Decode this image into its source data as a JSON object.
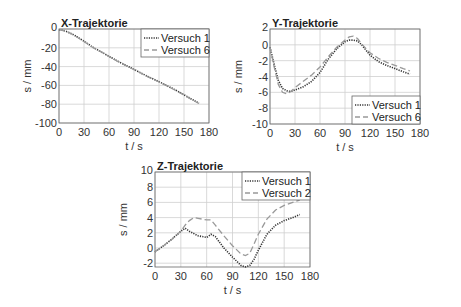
{
  "chart_data": [
    {
      "type": "line",
      "id": "x",
      "title": "X-Trajektorie",
      "xlabel": "t / s",
      "ylabel": "s / mm",
      "xlim": [
        0,
        180
      ],
      "ylim": [
        -100,
        0
      ],
      "xticks": [
        0,
        30,
        60,
        90,
        120,
        150,
        180
      ],
      "yticks": [
        0,
        -20,
        -40,
        -60,
        -80,
        -100
      ],
      "grid": true,
      "legend_position": "upper right",
      "frame": {
        "left": 59,
        "top": 29,
        "right": 209,
        "bottom": 123
      },
      "series": [
        {
          "name": "Versuch 1",
          "style": "dotted",
          "color": "#333333",
          "x": [
            0,
            5,
            10,
            15,
            20,
            30,
            40,
            50,
            60,
            70,
            80,
            90,
            100,
            110,
            120,
            130,
            140,
            150,
            160,
            168
          ],
          "y": [
            -1,
            -1.5,
            -3,
            -5,
            -7.5,
            -13,
            -19,
            -24,
            -29,
            -34,
            -38.5,
            -43,
            -47.5,
            -52,
            -56,
            -60.5,
            -65,
            -70,
            -75,
            -79
          ]
        },
        {
          "name": "Versuch 6",
          "style": "dashed",
          "color": "#999999",
          "x": [
            0,
            5,
            10,
            15,
            20,
            30,
            40,
            50,
            60,
            70,
            80,
            90,
            100,
            110,
            120,
            130,
            140,
            150,
            160,
            168
          ],
          "y": [
            -1,
            -1.6,
            -3.2,
            -5.2,
            -7.8,
            -13.3,
            -19.2,
            -24.3,
            -29.2,
            -34.2,
            -38.8,
            -43.2,
            -47.8,
            -52.2,
            -56.3,
            -60.8,
            -65.3,
            -70.3,
            -75.3,
            -79.3
          ]
        }
      ]
    },
    {
      "type": "line",
      "id": "y",
      "title": "Y-Trajektorie",
      "xlabel": "t / s",
      "ylabel": "s / mm",
      "xlim": [
        0,
        180
      ],
      "ylim": [
        -10,
        2
      ],
      "xticks": [
        0,
        30,
        60,
        90,
        120,
        150,
        180
      ],
      "yticks": [
        2,
        0,
        -2,
        -4,
        -6,
        -8,
        -10
      ],
      "grid": true,
      "legend_position": "lower right",
      "frame": {
        "left": 270,
        "top": 29,
        "right": 420,
        "bottom": 124
      },
      "series": [
        {
          "name": "Versuch 1",
          "style": "dotted",
          "color": "#333333",
          "x": [
            0,
            5,
            10,
            15,
            20,
            25,
            30,
            40,
            50,
            60,
            70,
            80,
            90,
            95,
            100,
            105,
            110,
            120,
            130,
            140,
            150,
            160,
            168
          ],
          "y": [
            -0.3,
            -2.5,
            -4.5,
            -5.5,
            -5.8,
            -5.9,
            -5.7,
            -5.3,
            -4.6,
            -3.5,
            -1.8,
            -0.5,
            0.4,
            0.6,
            0.6,
            0.5,
            0,
            -1.3,
            -2.1,
            -2.6,
            -3.0,
            -3.4,
            -3.7
          ]
        },
        {
          "name": "Versuch 6",
          "style": "dashed",
          "color": "#999999",
          "x": [
            0,
            5,
            10,
            15,
            20,
            25,
            30,
            40,
            50,
            60,
            70,
            80,
            90,
            95,
            100,
            105,
            110,
            120,
            130,
            140,
            150,
            160,
            168
          ],
          "y": [
            -0.3,
            -2.8,
            -5.0,
            -6.0,
            -6.2,
            -5.9,
            -5.4,
            -4.6,
            -3.8,
            -2.8,
            -1.5,
            -0.3,
            0.6,
            1.0,
            1.1,
            0.8,
            0.1,
            -1.0,
            -1.7,
            -2.2,
            -2.6,
            -3.0,
            -3.3
          ]
        }
      ]
    },
    {
      "type": "line",
      "id": "z",
      "title": "Z-Trajektorie",
      "xlabel": "t / s",
      "ylabel": "s / mm",
      "xlim": [
        0,
        180
      ],
      "ylim": [
        -2.5,
        10
      ],
      "xticks": [
        0,
        30,
        60,
        90,
        120,
        150,
        180
      ],
      "yticks": [
        10,
        8,
        6,
        4,
        2,
        0,
        -2
      ],
      "ytick_labels": [
        "10",
        "8",
        "6",
        "4",
        "2",
        "0",
        "-2"
      ],
      "grid": true,
      "legend_position": "upper right",
      "frame": {
        "left": 155,
        "top": 172,
        "right": 310,
        "bottom": 267
      },
      "series": [
        {
          "name": "Versuch 1",
          "style": "dotted",
          "color": "#333333",
          "x": [
            0,
            10,
            20,
            30,
            35,
            40,
            50,
            60,
            65,
            70,
            80,
            90,
            100,
            105,
            110,
            115,
            120,
            130,
            140,
            150,
            160,
            168
          ],
          "y": [
            -0.5,
            0.3,
            1.2,
            2.2,
            2.6,
            2.2,
            1.6,
            1.4,
            1.8,
            1.5,
            0,
            -1.2,
            -2.3,
            -2.5,
            -2.3,
            -1.5,
            -0.3,
            1.8,
            3.0,
            3.6,
            4.0,
            4.4
          ]
        },
        {
          "name": "Versuch 2",
          "style": "dashed",
          "color": "#999999",
          "x": [
            0,
            10,
            20,
            30,
            35,
            40,
            45,
            50,
            60,
            65,
            70,
            80,
            90,
            100,
            105,
            110,
            115,
            120,
            130,
            140,
            150,
            160,
            168
          ],
          "y": [
            -0.5,
            0.3,
            1.2,
            2.2,
            3.0,
            3.6,
            4.0,
            3.9,
            3.7,
            3.7,
            3.0,
            1.6,
            0.3,
            -0.8,
            -1.0,
            -0.7,
            0.5,
            1.8,
            3.8,
            5.0,
            5.6,
            6.0,
            6.3
          ]
        }
      ]
    }
  ]
}
